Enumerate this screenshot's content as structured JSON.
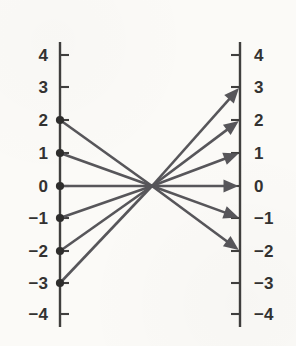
{
  "figure": {
    "background_color": "#fbfaf7",
    "axis_color": "#403f3e",
    "ray_color": "#57565a",
    "label_color": "#333231"
  },
  "chart_data": {
    "type": "mapping-diagram",
    "title": "",
    "subtitle": "",
    "xlabel": "",
    "ylabel": "",
    "grid": false,
    "legend": null,
    "axes": [
      {
        "name": "domain-axis",
        "side": "left",
        "x_px": 60,
        "tick_side": "right",
        "label_side": "left",
        "range": [
          -4,
          4
        ],
        "ticks": [
          {
            "value": 4,
            "label": "4",
            "y_px": 55,
            "has_point": false
          },
          {
            "value": 3,
            "label": "3",
            "y_px": 87,
            "has_point": false
          },
          {
            "value": 2,
            "label": "2",
            "y_px": 120,
            "has_point": true
          },
          {
            "value": 1,
            "label": "1",
            "y_px": 153,
            "has_point": true
          },
          {
            "value": 0,
            "label": "0",
            "y_px": 186,
            "has_point": true
          },
          {
            "value": -1,
            "label": "−1",
            "y_px": 218,
            "has_point": true
          },
          {
            "value": -2,
            "label": "−2",
            "y_px": 251,
            "has_point": true
          },
          {
            "value": -3,
            "label": "−3",
            "y_px": 283,
            "has_point": true
          },
          {
            "value": -4,
            "label": "−4",
            "y_px": 314,
            "has_point": false
          }
        ]
      },
      {
        "name": "range-axis",
        "side": "right",
        "x_px": 240,
        "tick_side": "left",
        "label_side": "right",
        "range": [
          -4,
          4
        ],
        "ticks": [
          {
            "value": 4,
            "label": "4",
            "y_px": 55,
            "has_arrow": false
          },
          {
            "value": 3,
            "label": "3",
            "y_px": 87,
            "has_arrow": true
          },
          {
            "value": 2,
            "label": "2",
            "y_px": 120,
            "has_arrow": true
          },
          {
            "value": 1,
            "label": "1",
            "y_px": 153,
            "has_arrow": true
          },
          {
            "value": 0,
            "label": "0",
            "y_px": 186,
            "has_arrow": true
          },
          {
            "value": -1,
            "label": "−1",
            "y_px": 218,
            "has_arrow": true
          },
          {
            "value": -2,
            "label": "−2",
            "y_px": 251,
            "has_arrow": true
          },
          {
            "value": -3,
            "label": "−3",
            "y_px": 283,
            "has_arrow": false
          },
          {
            "value": -4,
            "label": "−4",
            "y_px": 314,
            "has_arrow": false
          }
        ]
      }
    ],
    "pivot": {
      "x_px": 152,
      "y_px": 186
    },
    "mappings": [
      {
        "from": 2,
        "to": -2,
        "from_y_px": 120,
        "to_y_px": 251
      },
      {
        "from": 1,
        "to": -1,
        "from_y_px": 153,
        "to_y_px": 218
      },
      {
        "from": 0,
        "to": 0,
        "from_y_px": 186,
        "to_y_px": 186
      },
      {
        "from": -1,
        "to": 1,
        "from_y_px": 218,
        "to_y_px": 153
      },
      {
        "from": -2,
        "to": 2,
        "from_y_px": 251,
        "to_y_px": 120
      },
      {
        "from": -3,
        "to": 3,
        "from_y_px": 283,
        "to_y_px": 87
      }
    ]
  }
}
